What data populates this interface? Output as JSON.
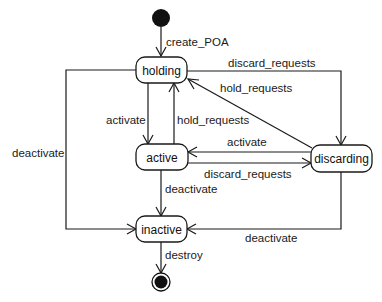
{
  "diagram": {
    "type": "uml-state-machine",
    "states": [
      {
        "id": "holding",
        "label": "holding"
      },
      {
        "id": "active",
        "label": "active"
      },
      {
        "id": "discarding",
        "label": "discarding"
      },
      {
        "id": "inactive",
        "label": "inactive"
      }
    ],
    "pseudo_states": {
      "initial": "initial",
      "final": "final"
    },
    "transitions": [
      {
        "from": "initial",
        "to": "holding",
        "label": "create_POA"
      },
      {
        "from": "holding",
        "to": "discarding",
        "label": "discard_requests"
      },
      {
        "from": "discarding",
        "to": "holding",
        "label": "hold_requests"
      },
      {
        "from": "holding",
        "to": "active",
        "label": "activate"
      },
      {
        "from": "active",
        "to": "holding",
        "label": "hold_requests"
      },
      {
        "from": "discarding",
        "to": "active",
        "label": "activate"
      },
      {
        "from": "active",
        "to": "discarding",
        "label": "discard_requests"
      },
      {
        "from": "holding",
        "to": "inactive",
        "label": "deactivate"
      },
      {
        "from": "active",
        "to": "inactive",
        "label": "deactivate"
      },
      {
        "from": "discarding",
        "to": "inactive",
        "label": "deactivate"
      },
      {
        "from": "inactive",
        "to": "final",
        "label": "destroy"
      }
    ]
  }
}
